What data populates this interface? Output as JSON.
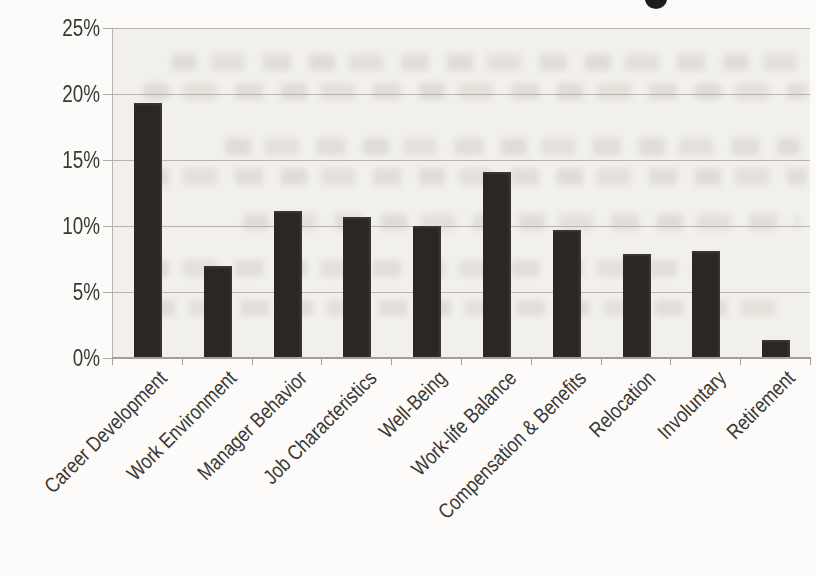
{
  "page": {
    "background_color": "#fcfbf9",
    "artifacts": {
      "partial_title_glyph": "bottom of a descender letter from a chart title cropped off at the top edge",
      "bleed_through": "faint illegible text showing through from the reverse side of the scanned page"
    }
  },
  "chart_data": {
    "type": "bar",
    "categories": [
      "Career Development",
      "Work Environment",
      "Manager Behavior",
      "Job Characteristics",
      "Well-Being",
      "Work-life Balance",
      "Compensation & Benefits",
      "Relocation",
      "Involuntary",
      "Retirement"
    ],
    "values": [
      19.3,
      7.0,
      11.1,
      10.7,
      10.0,
      14.1,
      9.7,
      7.9,
      8.1,
      1.4
    ],
    "value_unit": "%",
    "ylim": [
      0,
      25
    ],
    "yticks": [
      0,
      5,
      10,
      15,
      20,
      25
    ],
    "ytick_labels": [
      "0%",
      "5%",
      "10%",
      "15%",
      "20%",
      "25%"
    ],
    "xlabel": "",
    "ylabel": "",
    "grid": true,
    "legend": false,
    "x_tick_label_rotation_deg": 45,
    "bar_color": "#2a2725",
    "gridline_color": "#b7b4ae",
    "axis_color": "#a29e98",
    "label_color": "#3a3835",
    "plot_background": "#f2f0ec"
  }
}
